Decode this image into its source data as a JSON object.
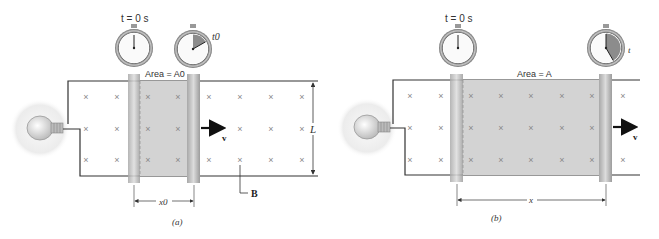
{
  "figure": {
    "panels": [
      {
        "id": "a",
        "caption": "(a)",
        "stopwatch_start_label": "t = 0 s",
        "stopwatch_end_label": "t0",
        "area_label": "Area = A0",
        "velocity_label": "v",
        "length_label": "L",
        "field_label": "B",
        "displacement_label": "x0"
      },
      {
        "id": "b",
        "caption": "(b)",
        "stopwatch_start_label": "t = 0 s",
        "stopwatch_end_label": "t",
        "area_label": "Area = A",
        "velocity_label": "v",
        "displacement_label": "x"
      }
    ],
    "colors": {
      "shaded_area": "#d3d3d3",
      "rod": "#b5b5b5",
      "rail": "#333333",
      "cross": "#888888",
      "bulb_glow": "#e8e8e8",
      "stopwatch_rim": "#9a9a9a",
      "stopwatch_wedge": "#8c8c8c"
    }
  }
}
